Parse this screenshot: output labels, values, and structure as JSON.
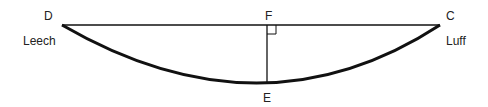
{
  "diagram": {
    "type": "sail-camber-diagram",
    "points": {
      "D": {
        "label": "D",
        "x": 62,
        "y": 25
      },
      "C": {
        "label": "C",
        "x": 440,
        "y": 25
      },
      "F": {
        "label": "F",
        "x": 267,
        "y": 25
      },
      "E": {
        "label": "E",
        "x": 267,
        "y": 83
      }
    },
    "edge_labels": {
      "leech": "Leech",
      "luff": "Luff"
    },
    "colors": {
      "line": "#111111",
      "curve": "#111111",
      "text": "#222222"
    }
  }
}
